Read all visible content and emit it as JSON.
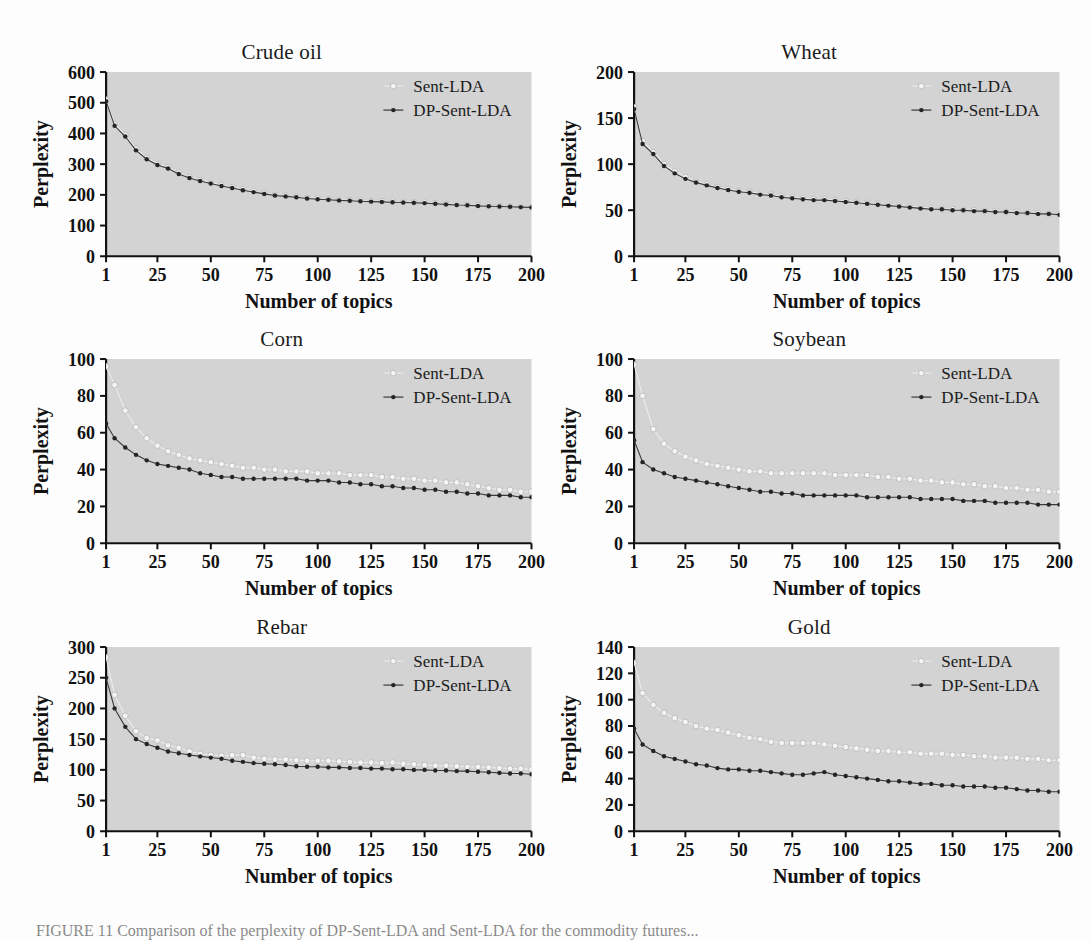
{
  "figure": {
    "background_color": "#fdfdfd",
    "plot_area_color": "#d3d3d3",
    "axis_color": "#111111",
    "caption": "FIGURE 11  Comparison of the perplexity of DP-Sent-LDA and Sent-LDA for the commodity futures..."
  },
  "legend": {
    "series1_label": "Sent-LDA",
    "series2_label": "DP-Sent-LDA",
    "series1_color": "#f2f2f2",
    "series2_color": "#262626",
    "series1_marker": "open-circle-light",
    "series2_marker": "filled-dot-dark",
    "position": "top-right"
  },
  "axes": {
    "xlabel": "Number of topics",
    "ylabel": "Perplexity",
    "xticks": [
      1,
      25,
      50,
      75,
      100,
      125,
      150,
      175,
      200
    ],
    "xlim": [
      1,
      200
    ]
  },
  "chart_data": [
    {
      "type": "line",
      "title": "Crude oil",
      "xlabel": "Number of topics",
      "ylabel": "Perplexity",
      "ylim": [
        0,
        600
      ],
      "yticks": [
        0,
        100,
        200,
        300,
        400,
        500,
        600
      ],
      "xlim": [
        1,
        200
      ],
      "xticks": [
        1,
        25,
        50,
        75,
        100,
        125,
        150,
        175,
        200
      ],
      "grid": false,
      "legend": [
        "Sent-LDA",
        "DP-Sent-LDA"
      ],
      "x": [
        1,
        5,
        10,
        15,
        20,
        25,
        30,
        35,
        40,
        45,
        50,
        55,
        60,
        65,
        70,
        75,
        80,
        85,
        90,
        95,
        100,
        105,
        110,
        115,
        120,
        125,
        130,
        135,
        140,
        145,
        150,
        155,
        160,
        165,
        170,
        175,
        180,
        185,
        190,
        195,
        200
      ],
      "series": [
        {
          "name": "Sent-LDA",
          "values": [
            510,
            430,
            395,
            350,
            320,
            300,
            290,
            272,
            258,
            248,
            240,
            232,
            225,
            218,
            212,
            205,
            200,
            197,
            194,
            190,
            188,
            186,
            184,
            183,
            181,
            180,
            179,
            178,
            177,
            176,
            175,
            173,
            171,
            169,
            167,
            166,
            165,
            163,
            162,
            161,
            160
          ]
        },
        {
          "name": "DP-Sent-LDA",
          "values": [
            505,
            425,
            390,
            345,
            316,
            297,
            286,
            268,
            255,
            245,
            237,
            229,
            222,
            215,
            209,
            203,
            198,
            195,
            192,
            188,
            186,
            184,
            182,
            181,
            179,
            178,
            177,
            176,
            175,
            174,
            173,
            171,
            169,
            167,
            166,
            164,
            163,
            162,
            161,
            160,
            159
          ]
        }
      ]
    },
    {
      "type": "line",
      "title": "Wheat",
      "xlabel": "Number of topics",
      "ylabel": "Perplexity",
      "ylim": [
        0,
        200
      ],
      "yticks": [
        0,
        50,
        100,
        150,
        200
      ],
      "xlim": [
        1,
        200
      ],
      "xticks": [
        1,
        25,
        50,
        75,
        100,
        125,
        150,
        175,
        200
      ],
      "grid": false,
      "legend": [
        "Sent-LDA",
        "DP-Sent-LDA"
      ],
      "x": [
        1,
        5,
        10,
        15,
        20,
        25,
        30,
        35,
        40,
        45,
        50,
        55,
        60,
        65,
        70,
        75,
        80,
        85,
        90,
        95,
        100,
        105,
        110,
        115,
        120,
        125,
        130,
        135,
        140,
        145,
        150,
        155,
        160,
        165,
        170,
        175,
        180,
        185,
        190,
        195,
        200
      ],
      "series": [
        {
          "name": "Sent-LDA",
          "values": [
            162,
            125,
            113,
            100,
            92,
            86,
            81,
            78,
            75,
            73,
            71,
            70,
            68,
            67,
            65,
            64,
            63,
            62,
            62,
            61,
            60,
            59,
            58,
            57,
            56,
            55,
            54,
            53,
            52,
            51,
            51,
            50,
            50,
            49,
            49,
            48,
            48,
            47,
            47,
            46,
            46
          ]
        },
        {
          "name": "DP-Sent-LDA",
          "values": [
            160,
            122,
            111,
            98,
            90,
            84,
            80,
            77,
            74,
            72,
            70,
            69,
            67,
            66,
            64,
            63,
            62,
            61,
            61,
            60,
            59,
            58,
            57,
            56,
            55,
            54,
            53,
            52,
            51,
            51,
            50,
            50,
            49,
            49,
            48,
            48,
            47,
            47,
            46,
            46,
            45
          ]
        }
      ]
    },
    {
      "type": "line",
      "title": "Corn",
      "xlabel": "Number of topics",
      "ylabel": "Perplexity",
      "ylim": [
        0,
        100
      ],
      "yticks": [
        0,
        20,
        40,
        60,
        80,
        100
      ],
      "xlim": [
        1,
        200
      ],
      "xticks": [
        1,
        25,
        50,
        75,
        100,
        125,
        150,
        175,
        200
      ],
      "grid": false,
      "legend": [
        "Sent-LDA",
        "DP-Sent-LDA"
      ],
      "x": [
        1,
        5,
        10,
        15,
        20,
        25,
        30,
        35,
        40,
        45,
        50,
        55,
        60,
        65,
        70,
        75,
        80,
        85,
        90,
        95,
        100,
        105,
        110,
        115,
        120,
        125,
        130,
        135,
        140,
        145,
        150,
        155,
        160,
        165,
        170,
        175,
        180,
        185,
        190,
        195,
        200
      ],
      "series": [
        {
          "name": "Sent-LDA",
          "values": [
            96,
            86,
            72,
            63,
            57,
            53,
            50,
            48,
            46,
            45,
            44,
            43,
            42,
            41,
            41,
            40,
            40,
            39,
            39,
            39,
            38,
            38,
            38,
            37,
            37,
            37,
            36,
            36,
            35,
            35,
            34,
            34,
            33,
            33,
            32,
            31,
            30,
            29,
            29,
            28,
            28
          ]
        },
        {
          "name": "DP-Sent-LDA",
          "values": [
            65,
            57,
            52,
            48,
            45,
            43,
            42,
            41,
            40,
            38,
            37,
            36,
            36,
            35,
            35,
            35,
            35,
            35,
            35,
            34,
            34,
            34,
            33,
            33,
            32,
            32,
            31,
            31,
            30,
            30,
            29,
            29,
            28,
            28,
            27,
            27,
            26,
            26,
            26,
            25,
            25
          ]
        }
      ]
    },
    {
      "type": "line",
      "title": "Soybean",
      "xlabel": "Number of topics",
      "ylabel": "Perplexity",
      "ylim": [
        0,
        100
      ],
      "yticks": [
        0,
        20,
        40,
        60,
        80,
        100
      ],
      "xlim": [
        1,
        200
      ],
      "xticks": [
        1,
        25,
        50,
        75,
        100,
        125,
        150,
        175,
        200
      ],
      "grid": false,
      "legend": [
        "Sent-LDA",
        "DP-Sent-LDA"
      ],
      "x": [
        1,
        5,
        10,
        15,
        20,
        25,
        30,
        35,
        40,
        45,
        50,
        55,
        60,
        65,
        70,
        75,
        80,
        85,
        90,
        95,
        100,
        105,
        110,
        115,
        120,
        125,
        130,
        135,
        140,
        145,
        150,
        155,
        160,
        165,
        170,
        175,
        180,
        185,
        190,
        195,
        200
      ],
      "series": [
        {
          "name": "Sent-LDA",
          "values": [
            97,
            80,
            62,
            54,
            50,
            47,
            45,
            43,
            42,
            41,
            40,
            39,
            39,
            38,
            38,
            38,
            38,
            38,
            38,
            37,
            37,
            37,
            37,
            36,
            36,
            35,
            35,
            34,
            34,
            33,
            33,
            32,
            32,
            31,
            31,
            30,
            30,
            29,
            29,
            28,
            28
          ]
        },
        {
          "name": "DP-Sent-LDA",
          "values": [
            56,
            44,
            40,
            38,
            36,
            35,
            34,
            33,
            32,
            31,
            30,
            29,
            28,
            28,
            27,
            27,
            26,
            26,
            26,
            26,
            26,
            26,
            25,
            25,
            25,
            25,
            25,
            24,
            24,
            24,
            24,
            23,
            23,
            23,
            22,
            22,
            22,
            22,
            21,
            21,
            21
          ]
        }
      ]
    },
    {
      "type": "line",
      "title": "Rebar",
      "xlabel": "Number of topics",
      "ylabel": "Perplexity",
      "ylim": [
        0,
        300
      ],
      "yticks": [
        0,
        50,
        100,
        150,
        200,
        250,
        300
      ],
      "xlim": [
        1,
        200
      ],
      "xticks": [
        1,
        25,
        50,
        75,
        100,
        125,
        150,
        175,
        200
      ],
      "grid": false,
      "legend": [
        "Sent-LDA",
        "DP-Sent-LDA"
      ],
      "x": [
        1,
        5,
        10,
        15,
        20,
        25,
        30,
        35,
        40,
        45,
        50,
        55,
        60,
        65,
        70,
        75,
        80,
        85,
        90,
        95,
        100,
        105,
        110,
        115,
        120,
        125,
        130,
        135,
        140,
        145,
        150,
        155,
        160,
        165,
        170,
        175,
        180,
        185,
        190,
        195,
        200
      ],
      "series": [
        {
          "name": "Sent-LDA",
          "values": [
            283,
            222,
            188,
            163,
            152,
            148,
            140,
            136,
            130,
            126,
            124,
            123,
            124,
            124,
            120,
            118,
            117,
            117,
            116,
            115,
            115,
            115,
            114,
            113,
            112,
            112,
            111,
            112,
            110,
            109,
            108,
            107,
            107,
            106,
            105,
            105,
            104,
            103,
            102,
            102,
            101
          ]
        },
        {
          "name": "DP-Sent-LDA",
          "values": [
            250,
            200,
            170,
            150,
            142,
            136,
            130,
            127,
            124,
            122,
            120,
            118,
            115,
            113,
            111,
            110,
            109,
            108,
            106,
            105,
            105,
            104,
            104,
            103,
            103,
            102,
            102,
            101,
            101,
            100,
            100,
            99,
            99,
            98,
            98,
            97,
            96,
            95,
            94,
            94,
            93
          ]
        }
      ]
    },
    {
      "type": "line",
      "title": "Gold",
      "xlabel": "Number of topics",
      "ylabel": "Perplexity",
      "ylim": [
        0,
        140
      ],
      "yticks": [
        0,
        20,
        40,
        60,
        80,
        100,
        120,
        140
      ],
      "xlim": [
        1,
        200
      ],
      "xticks": [
        1,
        25,
        50,
        75,
        100,
        125,
        150,
        175,
        200
      ],
      "grid": false,
      "legend": [
        "Sent-LDA",
        "DP-Sent-LDA"
      ],
      "x": [
        1,
        5,
        10,
        15,
        20,
        25,
        30,
        35,
        40,
        45,
        50,
        55,
        60,
        65,
        70,
        75,
        80,
        85,
        90,
        95,
        100,
        105,
        110,
        115,
        120,
        125,
        130,
        135,
        140,
        145,
        150,
        155,
        160,
        165,
        170,
        175,
        180,
        185,
        190,
        195,
        200
      ],
      "series": [
        {
          "name": "Sent-LDA",
          "values": [
            128,
            105,
            96,
            90,
            86,
            83,
            80,
            78,
            77,
            75,
            73,
            71,
            70,
            68,
            67,
            67,
            67,
            67,
            66,
            65,
            64,
            63,
            62,
            61,
            61,
            60,
            60,
            59,
            59,
            59,
            58,
            58,
            57,
            57,
            56,
            56,
            56,
            55,
            55,
            54,
            54
          ]
        },
        {
          "name": "DP-Sent-LDA",
          "values": [
            78,
            66,
            61,
            57,
            55,
            53,
            51,
            50,
            48,
            47,
            47,
            46,
            46,
            45,
            44,
            43,
            43,
            44,
            45,
            43,
            42,
            41,
            40,
            39,
            38,
            38,
            37,
            36,
            36,
            35,
            35,
            34,
            34,
            34,
            33,
            33,
            32,
            31,
            31,
            30,
            30
          ]
        }
      ]
    }
  ]
}
